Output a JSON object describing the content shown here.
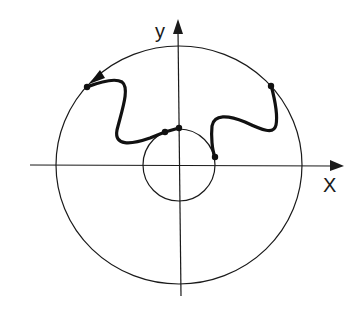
{
  "diagram": {
    "type": "polar-contour-figure",
    "axes": {
      "x_label": "X",
      "y_label": "y"
    },
    "colors": {
      "background": "#ffffff",
      "ink": "#1a1a1a"
    },
    "elements": {
      "outer_circle": "large circle centered at origin",
      "inner_circle": "small circle centered at origin",
      "path": "thick wavy path from inner circle to outer circle",
      "arrow": "arrowhead on outer circle indicating counter-clockwise direction",
      "points": 5
    }
  }
}
